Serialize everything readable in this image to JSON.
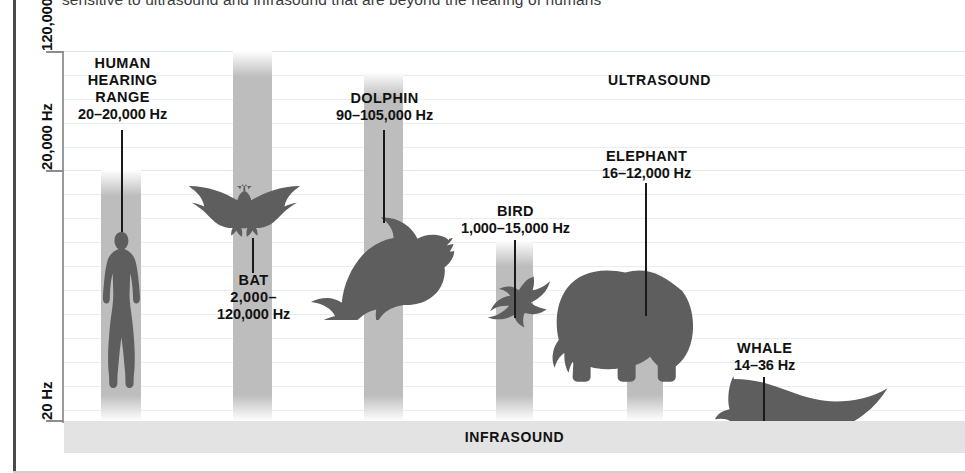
{
  "header": {
    "clipped_sentence": "sensitive to ultrasound and infrasound that are beyond the hearing of humans"
  },
  "axis": {
    "ticks": [
      {
        "label": "120,000 Hz",
        "y": 51
      },
      {
        "label": "20,000 Hz",
        "y": 170
      },
      {
        "label": "20 Hz",
        "y": 420
      }
    ]
  },
  "bands": {
    "ultrasound_label": "ULTRASOUND",
    "infrasound_label": "INFRASOUND"
  },
  "chart_data": {
    "type": "bar",
    "subtitle": "sensitive to ultrasound and infrasound that are beyond the hearing of humans",
    "ylabel": "Frequency",
    "xlabel": "",
    "yscale": "log",
    "ylim": [
      20,
      130000
    ],
    "grid": true,
    "legend": "none",
    "ytick_labels": [
      "120,000 Hz",
      "20,000 Hz",
      "20 Hz"
    ],
    "ytick_values": [
      120000,
      20000,
      20
    ],
    "annotations": [
      "ULTRASOUND",
      "INFRASOUND"
    ],
    "categories": [
      "HUMAN HEARING RANGE",
      "BAT",
      "DOLPHIN",
      "BIRD",
      "ELEPHANT",
      "WHALE"
    ],
    "series": [
      {
        "name": "min_hz",
        "values": [
          20,
          2000,
          90,
          1000,
          16,
          14
        ]
      },
      {
        "name": "max_hz",
        "values": [
          20000,
          120000,
          105000,
          15000,
          12000,
          36
        ]
      }
    ],
    "points": [
      {
        "name": "HUMAN HEARING RANGE",
        "range_text": "20–20,000 Hz",
        "min_hz": 20,
        "max_hz": 20000,
        "icon": "human-silhouette",
        "bar": {
          "left": 101,
          "top": 170,
          "width": 40,
          "height": 251
        },
        "label": {
          "left": 37,
          "top": 55,
          "lines": [
            "HUMAN",
            "HEARING",
            "RANGE",
            "20–20,000 Hz"
          ]
        },
        "leader": {
          "x": 121,
          "top": 130,
          "height": 102
        }
      },
      {
        "name": "BAT",
        "range_text": "2,000–120,000 Hz",
        "min_hz": 2000,
        "max_hz": 120000,
        "icon": "bat-silhouette",
        "bar": {
          "left": 233,
          "top": 51,
          "width": 39,
          "height": 370
        },
        "label": {
          "left": 181,
          "top": 272,
          "lines": [
            "BAT",
            "2,000–",
            "120,000 Hz"
          ]
        },
        "leader": {
          "x": 252,
          "top": 238,
          "height": 35
        }
      },
      {
        "name": "DOLPHIN",
        "range_text": "90–105,000 Hz",
        "min_hz": 90,
        "max_hz": 105000,
        "icon": "dolphin-silhouette",
        "bar": {
          "left": 364,
          "top": 72,
          "width": 39,
          "height": 349
        },
        "label": {
          "left": 315,
          "top": 90,
          "lines": [
            "DOLPHIN",
            "90–105,000 Hz"
          ]
        },
        "leader": {
          "x": 383,
          "top": 130,
          "height": 93
        }
      },
      {
        "name": "BIRD",
        "range_text": "1,000–15,000 Hz",
        "min_hz": 1000,
        "max_hz": 15000,
        "icon": "bird-silhouette",
        "bar": {
          "left": 496,
          "top": 240,
          "width": 37,
          "height": 181
        },
        "label": {
          "left": 449,
          "top": 203,
          "lines": [
            "BIRD",
            "1,000–15,000 Hz"
          ]
        },
        "leader": {
          "x": 514,
          "top": 240,
          "height": 78
        }
      },
      {
        "name": "ELEPHANT",
        "range_text": "16–12,000 Hz",
        "min_hz": 16,
        "max_hz": 12000,
        "icon": "elephant-silhouette",
        "bar": {
          "left": 627,
          "top": 270,
          "width": 36,
          "height": 151
        },
        "label": {
          "left": 578,
          "top": 148,
          "lines": [
            "ELEPHANT",
            "16–12,000 Hz"
          ]
        },
        "leader": {
          "x": 645,
          "top": 183,
          "height": 133
        }
      },
      {
        "name": "WHALE",
        "range_text": "14–36 Hz",
        "min_hz": 14,
        "max_hz": 36,
        "icon": "whale-silhouette",
        "bar": {
          "left": 745,
          "top": 394,
          "width": 36,
          "height": 38
        },
        "label": {
          "left": 721,
          "top": 340,
          "lines": [
            "WHALE",
            "14–36 Hz"
          ]
        },
        "leader": {
          "x": 763,
          "top": 377,
          "height": 47
        }
      }
    ]
  }
}
